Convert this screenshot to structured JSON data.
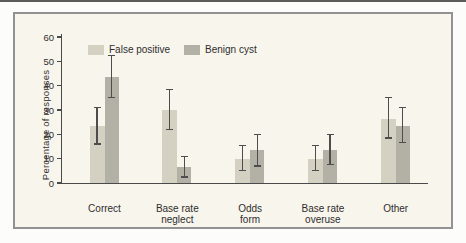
{
  "page": {
    "top_rule_color": "#5c5c5c",
    "panel_bg": "#f8f5ec",
    "panel_border": "#929292"
  },
  "chart_data": {
    "type": "bar",
    "title": "",
    "xlabel": "",
    "ylabel": "Percentage of responses",
    "ylim": [
      0,
      60
    ],
    "yticks": [
      0,
      10,
      20,
      30,
      40,
      50,
      60
    ],
    "grid": false,
    "legend_position": "top-left-inside",
    "categories": [
      "Correct",
      "Base rate neglect",
      "Odds form",
      "Base rate overuse",
      "Other"
    ],
    "category_label_lines": [
      [
        "Correct"
      ],
      [
        "Base rate",
        "neglect"
      ],
      [
        "Odds",
        "form"
      ],
      [
        "Base rate",
        "overuse"
      ],
      [
        "Other"
      ]
    ],
    "series": [
      {
        "name": "False positive",
        "color": "#d4d1c2",
        "values": [
          23.5,
          30,
          10,
          10,
          26.5
        ],
        "err_low": [
          16,
          22,
          5,
          5,
          18.5
        ],
        "err_high": [
          31,
          38.5,
          15.5,
          15.5,
          35
        ]
      },
      {
        "name": "Benign cyst",
        "color": "#b3b0a6",
        "values": [
          43.5,
          6.5,
          13.5,
          13.5,
          23.5
        ],
        "err_low": [
          35,
          2.5,
          7,
          7.5,
          16.5
        ],
        "err_high": [
          52.5,
          11,
          20,
          20,
          31
        ]
      }
    ],
    "error_bar_color": "#4d4d4d",
    "axis_color": "#4a4a4a",
    "text_color": "#2e2e2e"
  }
}
